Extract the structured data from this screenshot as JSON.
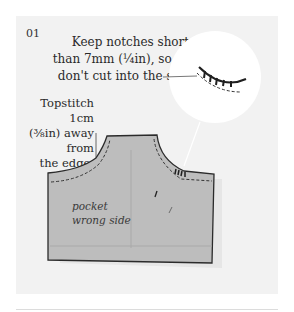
{
  "step": {
    "number": "01"
  },
  "callouts": {
    "notch_note": {
      "line1": "Keep notches shorter",
      "line2": "than 7mm (¼in), so they",
      "line3": "don't cut into the seam."
    },
    "topstitch_note": {
      "line1": "Topstitch 1cm",
      "line2": "(⅜in) away from",
      "line3": "the edge."
    }
  },
  "illustration": {
    "pocket_label_line1": "pocket",
    "pocket_label_line2": "wrong side",
    "fabric_color": "#bdbdbd",
    "outline_color": "#2b2b2b",
    "panel_color": "#f2f2f2",
    "magnifier_color": "#ffffff"
  }
}
